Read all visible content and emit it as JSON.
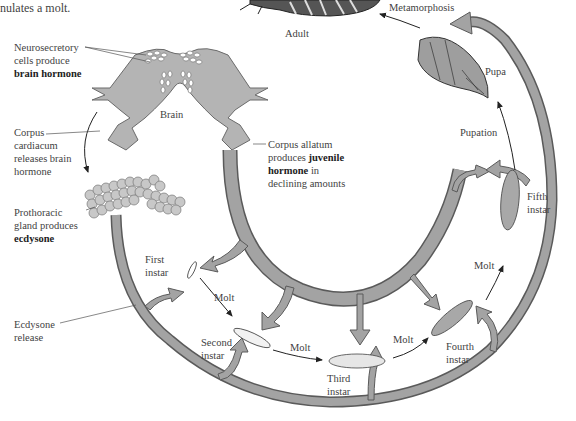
{
  "caption_fragment": "nulates a molt.",
  "colors": {
    "arrow_fill": "#9e9e9e",
    "arrow_stroke": "#5a5a5a",
    "tissue_fill": "#b4b4b4",
    "text": "#3f3f3f"
  },
  "stages": {
    "adult": "Adult",
    "pupa": "Pupa",
    "first_instar": [
      "First",
      "instar"
    ],
    "second_instar": [
      "Second",
      "instar"
    ],
    "third_instar": [
      "Third",
      "instar"
    ],
    "fourth_instar": [
      "Fourth",
      "instar"
    ],
    "fifth_instar": [
      "Fifth",
      "instar"
    ]
  },
  "transitions": {
    "metamorphosis": "Metamorphosis",
    "pupation": "Pupation",
    "molt_1": "Molt",
    "molt_2": "Molt",
    "molt_3": "Molt",
    "molt_4": "Molt"
  },
  "annotations": {
    "neurosecretory": [
      "Neurosecretory",
      "cells produce"
    ],
    "neurosecretory_bold": "brain hormone",
    "brain": "Brain",
    "corpus_cardiacum": [
      "Corpus",
      "cardiacum",
      "releases brain",
      "hormone"
    ],
    "corpus_allatum_1": "Corpus allatum",
    "corpus_allatum_2": "produces ",
    "corpus_allatum_bold_1": "juvenile",
    "corpus_allatum_bold_2": "hormone",
    "corpus_allatum_3": " in",
    "corpus_allatum_4": "declining amounts",
    "prothoracic": [
      "Prothoracic",
      "gland produces"
    ],
    "prothoracic_bold": "ecdysone",
    "ecdysone_release": [
      "Ecdysone",
      "release"
    ]
  }
}
